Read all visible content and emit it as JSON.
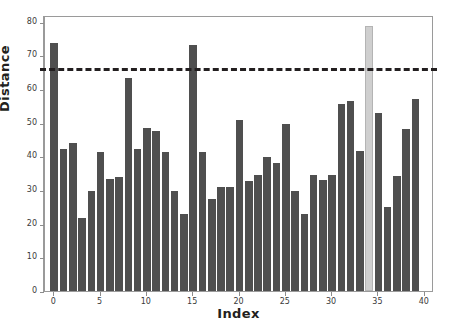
{
  "chart_data": {
    "type": "bar",
    "title": "",
    "subtitle": "",
    "xlabel": "Index",
    "ylabel": "Distance",
    "xlim": [
      -1,
      41
    ],
    "ylim": [
      0,
      82
    ],
    "ytick_labels": [
      "0",
      "10",
      "20",
      "30",
      "40",
      "50",
      "60",
      "70",
      "80"
    ],
    "ytick_values": [
      0,
      10,
      20,
      30,
      40,
      50,
      60,
      70,
      80
    ],
    "xtick_labels": [
      "0",
      "5",
      "10",
      "15",
      "20",
      "25",
      "30",
      "35",
      "40"
    ],
    "xtick_values": [
      0,
      5,
      10,
      15,
      20,
      25,
      30,
      35,
      40
    ],
    "grid": false,
    "legend": "none",
    "bar_color": "#4f4f4f",
    "highlight_color": "#cfcfcf",
    "highlight_index": 34,
    "annotations": [
      {
        "type": "hline",
        "label": "threshold",
        "value": 65.5,
        "style": "dashed",
        "color": "#231f20"
      }
    ],
    "categories": [
      0,
      1,
      2,
      3,
      4,
      5,
      6,
      7,
      8,
      9,
      10,
      11,
      12,
      13,
      14,
      15,
      16,
      17,
      18,
      19,
      20,
      21,
      22,
      23,
      24,
      25,
      26,
      27,
      28,
      29,
      30,
      31,
      32,
      33,
      34,
      35,
      36,
      37,
      38,
      39
    ],
    "values": [
      73.7,
      42.3,
      44.0,
      21.6,
      29.8,
      41.2,
      33.2,
      34.0,
      63.3,
      42.2,
      48.3,
      47.6,
      41.3,
      29.8,
      23.0,
      73.2,
      41.4,
      27.3,
      30.8,
      31.0,
      50.8,
      32.8,
      34.4,
      39.7,
      38.0,
      49.5,
      29.8,
      23.0,
      34.4,
      32.9,
      34.4,
      55.5,
      56.5,
      41.5,
      78.8,
      52.8,
      25.0,
      34.3,
      48.2,
      57.0
    ]
  }
}
